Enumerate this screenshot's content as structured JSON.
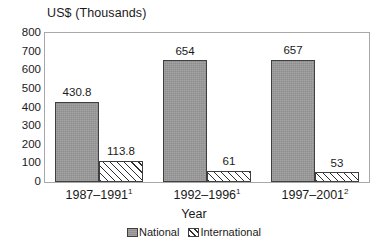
{
  "chart_data": {
    "type": "bar",
    "title": "US$ (Thousands)",
    "xlabel": "Year",
    "ylabel": "",
    "ylim": [
      0,
      800
    ],
    "ytick_step": 100,
    "yticks": [
      "800",
      "700",
      "600",
      "500",
      "400",
      "300",
      "200",
      "100",
      "0"
    ],
    "grid": false,
    "legend_position": "bottom-center",
    "categories": [
      "1987–1991",
      "1992–1996",
      "1997–2001"
    ],
    "category_superscripts": [
      "1",
      "1",
      "2"
    ],
    "series": [
      {
        "name": "National",
        "values": [
          430.8,
          654,
          657
        ],
        "labels": [
          "430.8",
          "654",
          "657"
        ],
        "fill": "solid-gray",
        "color": "#9a9a9a"
      },
      {
        "name": "International",
        "values": [
          113.8,
          61,
          53
        ],
        "labels": [
          "113.8",
          "61",
          "53"
        ],
        "fill": "diagonal-hatch",
        "color": "#ffffff"
      }
    ]
  },
  "legend": {
    "items": [
      {
        "label": "National"
      },
      {
        "label": "International"
      }
    ]
  },
  "colors": {
    "national_fill": "#9a9a9a",
    "international_fill": "#ffffff",
    "hatch": "#2e2e2e",
    "bar_outline": "#3f3f3f",
    "frame": "#a8a8a8",
    "text": "#1a1a1a",
    "background": "#ffffff"
  }
}
